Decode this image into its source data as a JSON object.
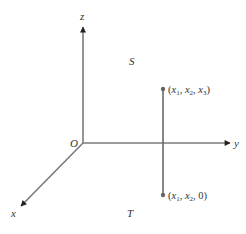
{
  "diagram": {
    "type": "3d-coordinate-axes",
    "colors": {
      "axis": "#7a7a7a",
      "text": "#333333",
      "point": "#666666"
    },
    "origin": {
      "label": "O",
      "pos": [
        83,
        143
      ]
    },
    "axes": [
      {
        "name": "z",
        "label": "z",
        "from": [
          83,
          143
        ],
        "to": [
          83,
          25
        ]
      },
      {
        "name": "y",
        "label": "y",
        "from": [
          83,
          143
        ],
        "to": [
          231,
          143
        ]
      },
      {
        "name": "x",
        "label": "x",
        "from": [
          83,
          143
        ],
        "to": [
          20,
          207
        ]
      }
    ],
    "regions": [
      {
        "label": "S"
      },
      {
        "label": "T"
      }
    ],
    "segment": {
      "top_point": {
        "label_open": "(",
        "x1": "x",
        "sub1": "1",
        "x2": "x",
        "sub2": "2",
        "x3": "x",
        "sub3": "3",
        "label_close": ")",
        "full_label": "(x1, x2, x3)"
      },
      "bottom_point": {
        "label_open": "(",
        "x1": "x",
        "sub1": "1",
        "x2": "x",
        "sub2": "2",
        "last": "0",
        "label_close": ")",
        "full_label": "(x1, x2, 0)"
      }
    }
  }
}
